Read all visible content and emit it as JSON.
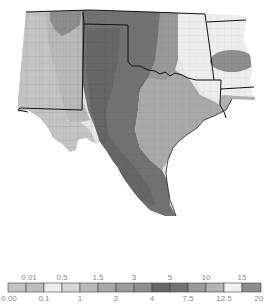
{
  "map": {
    "region": "South-central United States (New Mexico, Texas, Oklahoma, Arkansas, Louisiana)",
    "style": "grayscale choropleth with county boundaries",
    "states": [
      "New Mexico",
      "Texas",
      "Oklahoma",
      "Arkansas",
      "Louisiana"
    ]
  },
  "legend": {
    "classes": [
      {
        "from": "0.00",
        "to": "0.01",
        "color": "#c4c4c4"
      },
      {
        "from": "0.01",
        "to": "0.1",
        "color": "#bdbdbd"
      },
      {
        "from": "0.1",
        "to": "0.5",
        "color": "#ececec"
      },
      {
        "from": "0.5",
        "to": "1",
        "color": "#d6d6d6"
      },
      {
        "from": "1",
        "to": "1.5",
        "color": "#b9b9b9"
      },
      {
        "from": "1.5",
        "to": "2",
        "color": "#a9a9a9"
      },
      {
        "from": "2",
        "to": "3",
        "color": "#9b9b9b"
      },
      {
        "from": "3",
        "to": "4",
        "color": "#8e8e8e"
      },
      {
        "from": "4",
        "to": "5",
        "color": "#666666"
      },
      {
        "from": "5",
        "to": "7.5",
        "color": "#727272"
      },
      {
        "from": "7.5",
        "to": "10",
        "color": "#999999"
      },
      {
        "from": "10",
        "to": "12.5",
        "color": "#b2b2b2"
      },
      {
        "from": "12.5",
        "to": "15",
        "color": "#f0f0f0"
      },
      {
        "from": "15",
        "to": "20",
        "color": "#8c8c8c"
      }
    ],
    "top_labels": [
      "0.01",
      "0.5",
      "1.5",
      "3",
      "5",
      "10",
      "15"
    ],
    "bottom_labels": [
      "0.00",
      "0.1",
      "1",
      "2",
      "4",
      "7.5",
      "12.5",
      "20"
    ]
  }
}
